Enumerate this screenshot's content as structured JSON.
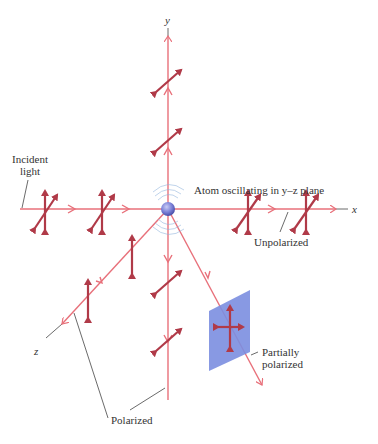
{
  "figure": {
    "axes": {
      "x": "x",
      "y": "y",
      "z": "z"
    },
    "labels": {
      "incident_line1": "Incident",
      "incident_line2": "light",
      "atom": "Atom oscillating in y–z plane",
      "unpolarized": "Unpolarized",
      "partially_line1": "Partially",
      "partially_line2": "polarized",
      "polarized": "Polarized"
    },
    "colors": {
      "ray": "#e8707a",
      "arrow": "#b03a48",
      "atom": "#7a7fd6",
      "polarizer": "#7b8ee0",
      "leader": "#444444"
    }
  }
}
